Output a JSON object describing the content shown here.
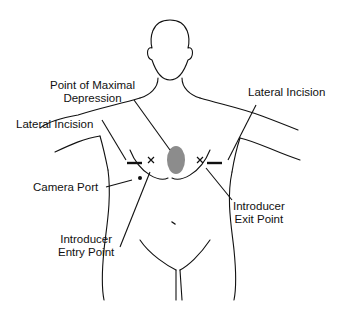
{
  "figure": {
    "colors": {
      "line": "#111111",
      "depression_marker": "#8c8c8c",
      "background": "#ffffff"
    }
  },
  "labels": {
    "point_of_maximal_depression": {
      "line1": "Point of Maximal",
      "line2": "Depression"
    },
    "lateral_incision_left": "Lateral Incision",
    "lateral_incision_right": "Lateral Incision",
    "camera_port": "Camera Port",
    "introducer_exit_point": {
      "line1": "Introducer",
      "line2": "Exit Point"
    },
    "introducer_entry_point": {
      "line1": "Introducer",
      "line2": "Entry Point"
    }
  },
  "markers": {
    "left_x": "×",
    "right_x": "×"
  }
}
